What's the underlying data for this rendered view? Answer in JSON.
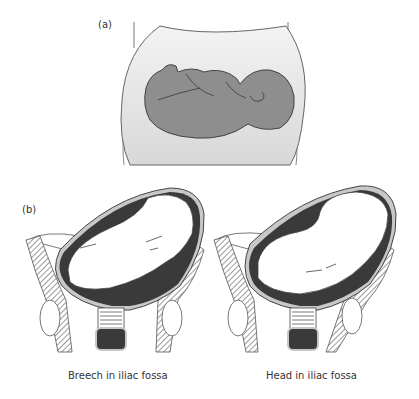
{
  "panel_a": {
    "label": "(a)",
    "description": "abdomen with fetus lying transversely",
    "colors": {
      "abdomen_fill": "#e4e4e4",
      "fetus_fill": "#8e8e8e",
      "outline": "#555555"
    }
  },
  "panel_b": {
    "label": "(b)",
    "figures": [
      {
        "caption": "Breech in iliac fossa"
      },
      {
        "caption": "Head in iliac fossa"
      }
    ],
    "colors": {
      "uterus_dark": "#3a3a3a",
      "fetus_fill": "#ffffff",
      "wall_fill": "#c8c8c8",
      "bone_hatch": "#555555"
    }
  }
}
